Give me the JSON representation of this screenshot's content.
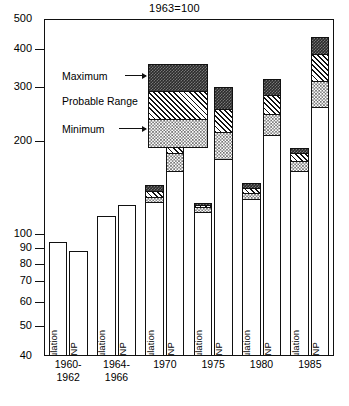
{
  "chart_data": {
    "type": "bar",
    "title": "1963=100",
    "subtitle": "",
    "xlabel": "",
    "ylabel": "",
    "scale": "log",
    "ylim": [
      40,
      500
    ],
    "grid": false,
    "legend_position": "inside-upper-left",
    "yticks": [
      40,
      50,
      60,
      70,
      80,
      90,
      100,
      200,
      300,
      400,
      500
    ],
    "ytick_labels": [
      "40",
      "50",
      "60",
      "70",
      "80",
      "90",
      "100",
      "200",
      "300",
      "400",
      "500"
    ],
    "categories": [
      "1960-\n1962",
      "1964-\n1966",
      "1970",
      "1975",
      "1980",
      "1985"
    ],
    "category_lines": [
      [
        "1960-",
        "1962"
      ],
      [
        "1964-",
        "1966"
      ],
      [
        "1970",
        ""
      ],
      [
        "1975",
        ""
      ],
      [
        "1980",
        ""
      ],
      [
        "1985",
        ""
      ]
    ],
    "bar_sublabels": [
      "Population",
      "GNP"
    ],
    "segment_names": [
      "Minimum",
      "Probable Range",
      "Maximum"
    ],
    "legend": [
      {
        "label": "Maximum",
        "pattern": "dark-checker"
      },
      {
        "label": "Probable Range",
        "pattern": "diagonal-hatch"
      },
      {
        "label": "Minimum",
        "pattern": "light-dots"
      }
    ],
    "series": [
      {
        "name": "Population",
        "bars": [
          {
            "group": "1960-1962",
            "base": 94,
            "min_top": 94,
            "range_top": 94,
            "max_top": 94
          },
          {
            "group": "1964-1966",
            "base": 114,
            "min_top": 114,
            "range_top": 114,
            "max_top": 114
          },
          {
            "group": "1970",
            "base": 127,
            "min_top": 132,
            "range_top": 138,
            "max_top": 144
          },
          {
            "group": "1975",
            "base": 118,
            "min_top": 122,
            "range_top": 124,
            "max_top": 126
          },
          {
            "group": "1980",
            "base": 130,
            "min_top": 136,
            "range_top": 141,
            "max_top": 146
          },
          {
            "group": "1985",
            "base": 160,
            "min_top": 172,
            "range_top": 183,
            "max_top": 190
          }
        ]
      },
      {
        "name": "GNP",
        "bars": [
          {
            "group": "1960-1962",
            "base": 88,
            "min_top": 88,
            "range_top": 88,
            "max_top": 88
          },
          {
            "group": "1964-1966",
            "base": 124,
            "min_top": 124,
            "range_top": 124,
            "max_top": 124
          },
          {
            "group": "1970",
            "base": 160,
            "min_top": 183,
            "range_top": 201,
            "max_top": 222
          },
          {
            "group": "1975",
            "base": 175,
            "min_top": 215,
            "range_top": 255,
            "max_top": 300
          },
          {
            "group": "1980",
            "base": 210,
            "min_top": 245,
            "range_top": 283,
            "max_top": 318
          },
          {
            "group": "1985",
            "base": 258,
            "min_top": 315,
            "range_top": 385,
            "max_top": 437
          }
        ]
      }
    ]
  },
  "axis": {
    "tick_40": "40",
    "tick_50": "50",
    "tick_60": "60",
    "tick_70": "70",
    "tick_80": "80",
    "tick_90": "90",
    "tick_100": "100",
    "tick_200": "200",
    "tick_300": "300",
    "tick_400": "400",
    "tick_500": "500"
  },
  "labels": {
    "population": "Population",
    "gnp": "GNP"
  }
}
